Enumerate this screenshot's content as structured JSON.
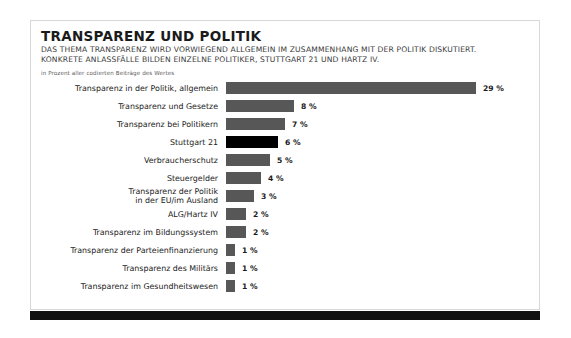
{
  "card": {
    "title": "TRANSPARENZ UND POLITIK",
    "subtitle_line1": "DAS THEMA TRANSPARENZ WIRD VORWIEGEND ALLGEMEIN IM ZUSAMMENHANG MIT DER POLITIK DISKUTIERT.",
    "subtitle_line2": "KONKRETE ANLASSFÄLLE BILDEN EINZELNE POLITIKER, STUTTGART 21 UND HARTZ IV.",
    "note": "in Prozent aller codierten Beiträge des Wertes"
  },
  "colors": {
    "bar": "#575757",
    "bar_highlight": "#000000",
    "footer": "#111111",
    "card_border": "#d8d8d8",
    "text": "#1b1b1b"
  },
  "chart_data": {
    "type": "bar",
    "orientation": "horizontal",
    "title": "TRANSPARENZ UND POLITIK",
    "subtitle": "DAS THEMA TRANSPARENZ WIRD VORWIEGEND ALLGEMEIN IM ZUSAMMENHANG MIT DER POLITIK DISKUTIERT. KONKRETE ANLASSFÄLLE BILDEN EINZELNE POLITIKER, STUTTGART 21 UND HARTZ IV.",
    "xlabel": "",
    "ylabel": "",
    "unit": "%",
    "note": "in Prozent aller codierten Beiträge des Wertes",
    "grid": false,
    "legend": "none",
    "xlim": [
      0,
      29
    ],
    "categories": [
      "Transparenz in der Politik, allgemein",
      "Transparenz und Gesetze",
      "Transparenz bei Politikern",
      "Stuttgart 21",
      "Verbraucherschutz",
      "Steuergelder",
      "Transparenz der Politik\nin der EU/im Ausland",
      "ALG/Hartz IV",
      "Transparenz im Bildungssystem",
      "Transparenz der Parteienfinanzierung",
      "Transparenz des Militärs",
      "Transparenz im Gesundheitswesen"
    ],
    "values": [
      29,
      8,
      7,
      6,
      5,
      4,
      3,
      2,
      2,
      1,
      1,
      1
    ],
    "value_labels": [
      "29 %",
      "8 %",
      "7 %",
      "6 %",
      "5 %",
      "4 %",
      "3 %",
      "2 %",
      "2 %",
      "1 %",
      "1 %",
      "1 %"
    ],
    "bar_px": [
      250,
      68,
      59,
      52,
      44,
      35,
      28,
      20,
      20,
      9,
      9,
      9
    ],
    "highlight_index": 3
  },
  "rows": [
    {
      "label": "Transparenz in der Politik, allgemein",
      "value_label": "29 %",
      "width": 250,
      "highlight": false
    },
    {
      "label": "Transparenz und Gesetze",
      "value_label": "8 %",
      "width": 68,
      "highlight": false
    },
    {
      "label": "Transparenz bei Politikern",
      "value_label": "7 %",
      "width": 59,
      "highlight": false
    },
    {
      "label": "Stuttgart 21",
      "value_label": "6 %",
      "width": 52,
      "highlight": true
    },
    {
      "label": "Verbraucherschutz",
      "value_label": "5 %",
      "width": 44,
      "highlight": false
    },
    {
      "label": "Steuergelder",
      "value_label": "4 %",
      "width": 35,
      "highlight": false
    },
    {
      "label": "Transparenz der Politik\nin der EU/im Ausland",
      "value_label": "3 %",
      "width": 28,
      "highlight": false
    },
    {
      "label": "ALG/Hartz IV",
      "value_label": "2 %",
      "width": 20,
      "highlight": false
    },
    {
      "label": "Transparenz im Bildungssystem",
      "value_label": "2 %",
      "width": 20,
      "highlight": false
    },
    {
      "label": "Transparenz der Parteienfinanzierung",
      "value_label": "1 %",
      "width": 9,
      "highlight": false
    },
    {
      "label": "Transparenz des Militärs",
      "value_label": "1 %",
      "width": 9,
      "highlight": false
    },
    {
      "label": "Transparenz im Gesundheitswesen",
      "value_label": "1 %",
      "width": 9,
      "highlight": false
    }
  ]
}
